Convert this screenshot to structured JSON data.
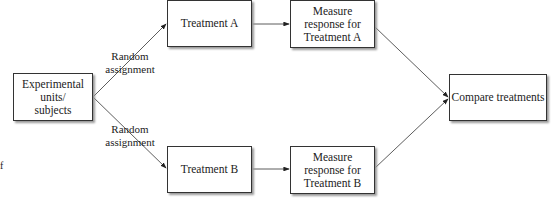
{
  "diagram": {
    "nodes": {
      "units": "Experimental units/ subjects",
      "units_lines": [
        "Experimental",
        "units/",
        "subjects"
      ],
      "treatment_a": "Treatment A",
      "treatment_b": "Treatment B",
      "measure_a_lines": [
        "Measure",
        "response for",
        "Treatment A"
      ],
      "measure_b_lines": [
        "Measure",
        "response for",
        "Treatment B"
      ],
      "compare": "Compare treatments"
    },
    "edge_labels": {
      "top": [
        "Random",
        "assignment"
      ],
      "bottom": [
        "Random",
        "assignment"
      ]
    },
    "stray_text": "f"
  }
}
